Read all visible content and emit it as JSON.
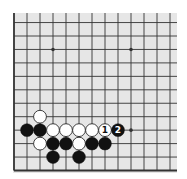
{
  "diagram": {
    "visible_columns": 13,
    "visible_rows": 12,
    "edges": [
      "left",
      "bottom"
    ],
    "colors": {
      "board": "#e6e6e6",
      "line": "#333333",
      "black_stone": "#111111",
      "white_stone": "#ffffff"
    },
    "star_points": [
      {
        "col": 3,
        "row": 9
      },
      {
        "col": 9,
        "row": 9
      },
      {
        "col": 9,
        "row": 3
      }
    ],
    "stones": [
      {
        "color": "white",
        "col": 2,
        "row": 4,
        "label": ""
      },
      {
        "color": "black",
        "col": 1,
        "row": 3,
        "label": ""
      },
      {
        "color": "black",
        "col": 2,
        "row": 3,
        "label": ""
      },
      {
        "color": "white",
        "col": 3,
        "row": 3,
        "label": ""
      },
      {
        "color": "white",
        "col": 4,
        "row": 3,
        "label": ""
      },
      {
        "color": "white",
        "col": 5,
        "row": 3,
        "label": ""
      },
      {
        "color": "white",
        "col": 6,
        "row": 3,
        "label": ""
      },
      {
        "color": "white",
        "col": 7,
        "row": 3,
        "label": "1"
      },
      {
        "color": "black",
        "col": 8,
        "row": 3,
        "label": "2"
      },
      {
        "color": "white",
        "col": 2,
        "row": 2,
        "label": ""
      },
      {
        "color": "black",
        "col": 3,
        "row": 2,
        "label": ""
      },
      {
        "color": "black",
        "col": 4,
        "row": 2,
        "label": ""
      },
      {
        "color": "white",
        "col": 5,
        "row": 2,
        "label": ""
      },
      {
        "color": "black",
        "col": 6,
        "row": 2,
        "label": ""
      },
      {
        "color": "black",
        "col": 7,
        "row": 2,
        "label": ""
      },
      {
        "color": "black",
        "col": 3,
        "row": 1,
        "label": ""
      },
      {
        "color": "black",
        "col": 5,
        "row": 1,
        "label": ""
      }
    ]
  }
}
